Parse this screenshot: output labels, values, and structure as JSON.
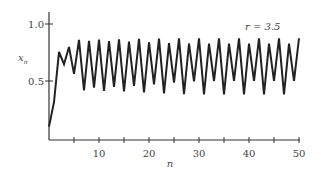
{
  "chart_data": {
    "type": "line",
    "title": "",
    "annotation": "r = 3.5",
    "xlabel": "n",
    "ylabel": "x_n",
    "xlim": [
      0,
      50
    ],
    "ylim": [
      0,
      1.1
    ],
    "grid": false,
    "x_ticks": [
      5,
      10,
      15,
      20,
      25,
      30,
      35,
      40,
      45,
      50
    ],
    "x_tick_labels": [
      "10",
      "20",
      "30",
      "40",
      "50"
    ],
    "y_ticks": [
      0.5,
      1.0
    ],
    "y_tick_labels": [
      "0.5",
      "1.0"
    ],
    "series": [
      {
        "name": "logistic map r=3.5",
        "x": [
          0,
          1,
          2,
          3,
          4,
          5,
          6,
          7,
          8,
          9,
          10,
          11,
          12,
          13,
          14,
          15,
          16,
          17,
          18,
          19,
          20,
          21,
          22,
          23,
          24,
          25,
          26,
          27,
          28,
          29,
          30,
          31,
          32,
          33,
          34,
          35,
          36,
          37,
          38,
          39,
          40,
          41,
          42,
          43,
          44,
          45,
          46,
          47,
          48,
          49,
          50
        ],
        "values": [
          0.1,
          0.315,
          0.755,
          0.647,
          0.799,
          0.562,
          0.861,
          0.418,
          0.852,
          0.442,
          0.863,
          0.414,
          0.849,
          0.448,
          0.865,
          0.408,
          0.846,
          0.457,
          0.869,
          0.4,
          0.84,
          0.47,
          0.872,
          0.391,
          0.833,
          0.486,
          0.874,
          0.385,
          0.829,
          0.496,
          0.875,
          0.383,
          0.827,
          0.5,
          0.875,
          0.383,
          0.827,
          0.501,
          0.875,
          0.383,
          0.827,
          0.501,
          0.875,
          0.383,
          0.827,
          0.501,
          0.875,
          0.383,
          0.827,
          0.501,
          0.875
        ]
      }
    ]
  },
  "labels": {
    "annotation": "r = 3.5",
    "xlabel": "n",
    "ylabel_main": "x",
    "ylabel_sub": "n",
    "y_ticks": [
      "1.0",
      "0.5"
    ],
    "x_ticks": [
      "10",
      "20",
      "30",
      "40",
      "50"
    ]
  }
}
